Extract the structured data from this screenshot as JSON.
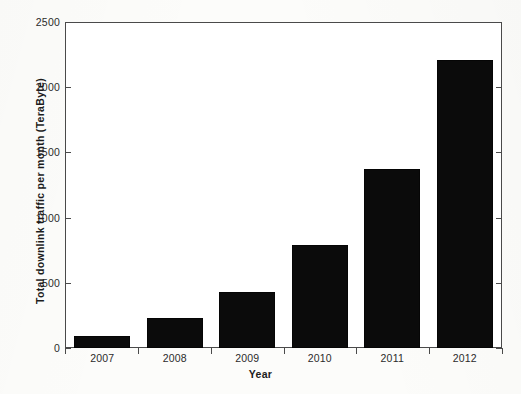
{
  "figure": {
    "background_color": "#fcfcfa",
    "axis_color": "#4a4a4a",
    "bar_color": "#0b0b0b"
  },
  "chart_data": {
    "type": "bar",
    "title": "",
    "subtitle": "",
    "xlabel": "Year",
    "ylabel": "Total downlink traffic per month (TeraByte)",
    "categories": [
      "2007",
      "2008",
      "2009",
      "2010",
      "2011",
      "2012"
    ],
    "values": [
      92,
      230,
      430,
      790,
      1380,
      2215
    ],
    "series": [
      {
        "name": "Total downlink traffic per month (TeraByte)",
        "values": [
          92,
          230,
          430,
          790,
          1380,
          2215
        ]
      }
    ],
    "ylim": [
      0,
      2500
    ],
    "ytick_labels": [
      "0",
      "500",
      "1000",
      "1500",
      "2000",
      "2500"
    ],
    "ytick_values": [
      0,
      500,
      1000,
      1500,
      2000,
      2500
    ],
    "xtick_labels": [
      "2007",
      "2008",
      "2009",
      "2010",
      "2011",
      "2012"
    ],
    "grid": false,
    "legend": null,
    "legend_position": "none",
    "annotations": []
  }
}
